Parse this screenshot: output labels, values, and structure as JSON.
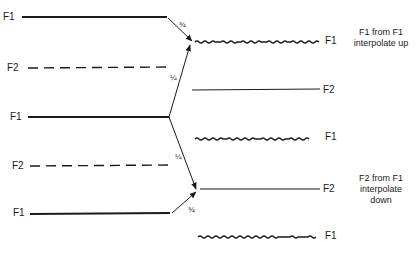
{
  "diagram": {
    "left_lines": [
      {
        "label": "F1",
        "style": "solid"
      },
      {
        "label": "F2",
        "style": "dashed"
      },
      {
        "label": "F1",
        "style": "solid"
      },
      {
        "label": "F2",
        "style": "dashed"
      },
      {
        "label": "F1",
        "style": "solid"
      }
    ],
    "right_lines": [
      {
        "label": "F1",
        "style": "wavy"
      },
      {
        "label": "F2",
        "style": "solid"
      },
      {
        "label": "F1",
        "style": "wavy"
      },
      {
        "label": "F2",
        "style": "solid"
      },
      {
        "label": "F1",
        "style": "wavy"
      }
    ],
    "arrows": [
      {
        "from": "left F1 (top)",
        "to": "right F1 (top)",
        "weight": "¾"
      },
      {
        "from": "left F1 (middle)",
        "to": "right F1 (top)",
        "weight": "¼"
      },
      {
        "from": "left F1 (middle)",
        "to": "right F2 (lower)",
        "weight": "¼"
      },
      {
        "from": "left F1 (bottom)",
        "to": "right F2 (lower)",
        "weight": "¾"
      }
    ],
    "annotations": {
      "up": {
        "line1": "F1 from F1",
        "line2": "interpolate up"
      },
      "down": {
        "line1": "F2 from F1",
        "line2": "interpolate",
        "line3": "down"
      }
    }
  }
}
